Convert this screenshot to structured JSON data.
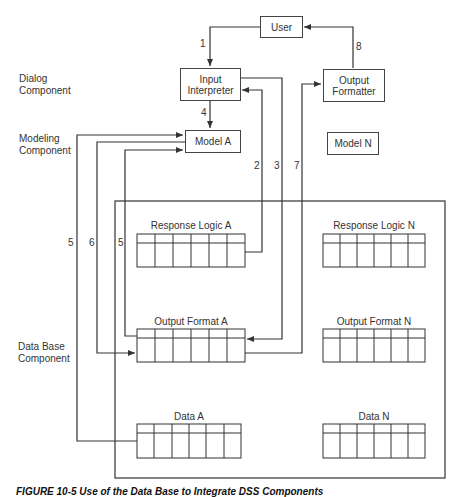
{
  "components": {
    "dialog": "Dialog\nComponent",
    "dialog_line1": "Dialog",
    "dialog_line2": "Component",
    "modeling_line1": "Modeling",
    "modeling_line2": "Component",
    "database_line1": "Data Base",
    "database_line2": "Component"
  },
  "boxes": {
    "user": "User",
    "input_interpreter_line1": "Input",
    "input_interpreter_line2": "Interpreter",
    "output_formatter_line1": "Output",
    "output_formatter_line2": "Formatter",
    "model_a": "Model A",
    "model_n": "Model N"
  },
  "tables": {
    "response_logic_a": "Response Logic A",
    "response_logic_n": "Response Logic N",
    "output_format_a": "Output Format A",
    "output_format_n": "Output Format N",
    "data_a": "Data A",
    "data_n": "Data N",
    "columns": 6
  },
  "flows": {
    "f1": "1",
    "f2": "2",
    "f3": "3",
    "f4": "4",
    "f5_outer": "5",
    "f6": "6",
    "f5_inner": "5",
    "f7": "7",
    "f8": "8"
  },
  "caption": "FIGURE 10-5   Use of the Data Base to Integrate DSS Components"
}
